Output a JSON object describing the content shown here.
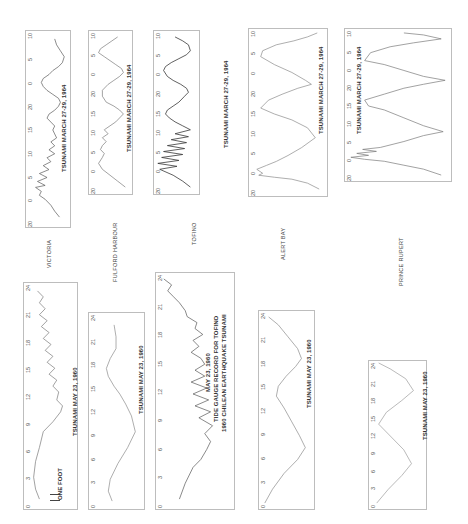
{
  "stations": [
    "VICTORIA",
    "FULFORD HARBOUR",
    "TOFINO",
    "ALERT BAY",
    "PRINCE RUPERT"
  ],
  "captions": {
    "y1964": "TSUNAMI MARCH 27-29, 1964",
    "y1960": "TSUNAMI MAY 23, 1960",
    "tofino1960_line1": "MAY 23, 1960",
    "tofino1960_line2": "TIDE GAUGE RECORD FOR TOFINO",
    "tofino1960_line3": "1960 CHILEAN EARTHQUAKE TSUNAMI",
    "scale": "ONE FOOT"
  },
  "ticks1964": [
    "20",
    "0",
    "5",
    "10",
    "15",
    "20",
    "0",
    "5",
    "10"
  ],
  "ticks1960": [
    "0",
    "3",
    "6",
    "9",
    "12",
    "15",
    "18",
    "21",
    "24"
  ],
  "chart_data": [
    {
      "type": "line",
      "title": "VICTORIA — TSUNAMI MARCH 27-29, 1964",
      "xlabel": "hour",
      "x_ticks": [
        "20",
        "0",
        "5",
        "10",
        "15",
        "20",
        "0",
        "5",
        "10"
      ],
      "y": [
        0.2,
        0.6,
        0.1,
        0.8,
        0.3,
        0.7,
        0.5,
        0.6,
        0.7,
        0.4,
        0.5,
        0.3,
        0.6,
        0.4,
        0.3,
        0.2,
        0.5,
        0.6,
        0.7
      ]
    },
    {
      "type": "line",
      "title": "FULFORD HARBOUR — TSUNAMI MARCH 27-29, 1964",
      "xlabel": "hour",
      "x_ticks": [
        "20",
        "0",
        "5",
        "10",
        "15",
        "20",
        "0",
        "5",
        "10"
      ],
      "y": [
        0.3,
        0.8,
        0.5,
        0.3,
        0.2,
        0.6,
        0.8,
        0.6,
        0.4,
        0.3,
        0.4,
        0.7,
        0.9,
        0.6,
        0.3,
        0.1,
        0.4
      ]
    },
    {
      "type": "line",
      "title": "TOFINO — TSUNAMI MARCH 27-29, 1964",
      "xlabel": "hour",
      "x_ticks": [
        "20",
        "0",
        "5",
        "10",
        "15",
        "20",
        "0",
        "5",
        "10"
      ],
      "y": [
        0.2,
        0.9,
        0.1,
        0.8,
        0.2,
        0.7,
        0.3,
        0.6,
        0.2,
        0.5,
        0.9,
        0.4,
        0.1,
        0.6,
        0.9,
        0.4,
        0.1
      ]
    },
    {
      "type": "line",
      "title": "ALERT BAY — TSUNAMI MARCH 27-29, 1964",
      "xlabel": "hour",
      "x_ticks": [
        "20",
        "0",
        "5",
        "10",
        "15",
        "20",
        "0",
        "5",
        "10"
      ],
      "y": [
        0.1,
        0.9,
        0.7,
        0.5,
        0.2,
        0.4,
        0.9,
        0.6,
        0.3,
        0.1,
        0.4,
        0.8,
        0.6,
        0.2,
        0.1
      ]
    },
    {
      "type": "line",
      "title": "PRINCE RUPERT — TSUNAMI MARCH 27-29, 1964",
      "xlabel": "hour",
      "x_ticks": [
        "20",
        "0",
        "5",
        "10",
        "15",
        "20",
        "0",
        "5",
        "10"
      ],
      "y": [
        0.1,
        0.95,
        0.6,
        0.8,
        0.3,
        0.1,
        0.6,
        0.9,
        0.5,
        0.1,
        0.5,
        0.95,
        0.4,
        0.05,
        0.3
      ]
    },
    {
      "type": "line",
      "title": "VICTORIA — TSUNAMI MAY 23, 1960",
      "xlabel": "hour",
      "x_ticks": [
        "0",
        "3",
        "6",
        "9",
        "12",
        "15",
        "18",
        "21",
        "24"
      ],
      "y": [
        0.4,
        0.2,
        0.5,
        0.8,
        0.7,
        0.6,
        0.7,
        0.5,
        0.6,
        0.4,
        0.5,
        0.6,
        0.5
      ]
    },
    {
      "type": "line",
      "title": "FULFORD HARBOUR — TSUNAMI MAY 23, 1960",
      "xlabel": "hour",
      "x_ticks": [
        "0",
        "3",
        "6",
        "9",
        "12",
        "15",
        "18",
        "21",
        "24"
      ],
      "y": [
        0.5,
        0.3,
        0.6,
        0.9,
        0.7,
        0.4,
        0.2,
        0.3,
        0.5
      ]
    },
    {
      "type": "line",
      "title": "TOFINO — MAY 23, 1960 TIDE GAUGE RECORD FOR TOFINO, 1960 CHILEAN EARTHQUAKE TSUNAMI",
      "xlabel": "hour",
      "x_ticks": [
        "0",
        "3",
        "6",
        "9",
        "12",
        "15",
        "18",
        "21",
        "24"
      ],
      "y": [
        0.2,
        0.6,
        0.8,
        0.5,
        0.3,
        0.6,
        0.4,
        0.6,
        0.3,
        0.1
      ]
    },
    {
      "type": "line",
      "title": "ALERT BAY — TSUNAMI MAY 23, 1960",
      "xlabel": "hour",
      "x_ticks": [
        "0",
        "3",
        "6",
        "9",
        "12",
        "15",
        "18",
        "21",
        "24"
      ],
      "y": [
        0.1,
        0.6,
        0.9,
        0.6,
        0.2,
        0.5,
        0.8,
        0.5,
        0.1
      ]
    },
    {
      "type": "line",
      "title": "PRINCE RUPERT — TSUNAMI MAY 23, 1960",
      "xlabel": "hour",
      "x_ticks": [
        "0",
        "3",
        "6",
        "9",
        "12",
        "15",
        "18",
        "21",
        "24"
      ],
      "y": [
        0.1,
        0.8,
        0.3,
        0.8,
        0.1
      ]
    }
  ]
}
